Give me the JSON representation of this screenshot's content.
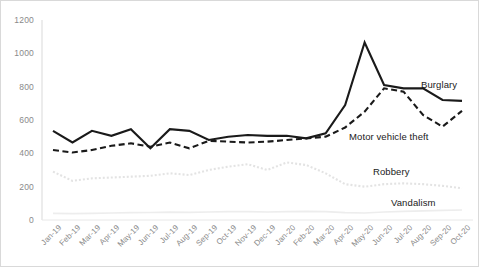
{
  "chart_data": {
    "type": "line",
    "title": "",
    "subtitle": "",
    "xlabel": "",
    "ylabel": "",
    "ylim": [
      0,
      1200
    ],
    "yticks": [
      0,
      200,
      400,
      600,
      800,
      1000,
      1200
    ],
    "ytick_labels": [
      "0",
      "200",
      "400",
      "600",
      "800",
      "1000",
      "1200"
    ],
    "grid": false,
    "legend_position": "inline-right",
    "categories": [
      "Jan-19",
      "Feb-19",
      "Mar-19",
      "Apr-19",
      "May-19",
      "Jun-19",
      "Jul-19",
      "Aug-19",
      "Sep-19",
      "Oct-19",
      "Nov-19",
      "Dec-19",
      "Jan-20",
      "Feb-20",
      "Mar-20",
      "Apr-20",
      "May-20",
      "Jun-20",
      "Jul-20",
      "Aug-20",
      "Sep-20",
      "Oct-20"
    ],
    "series": [
      {
        "name": "Burglary",
        "color": "#1a1a1a",
        "style": "solid",
        "width": 2.1,
        "label_x": 420,
        "label_y": 78,
        "values": [
          535,
          465,
          535,
          505,
          545,
          430,
          545,
          535,
          480,
          500,
          510,
          505,
          505,
          490,
          520,
          690,
          1065,
          810,
          790,
          790,
          720,
          715
        ]
      },
      {
        "name": "Motor vehicle theft",
        "color": "#1a1a1a",
        "style": "dashed",
        "width": 2.1,
        "label_x": 348,
        "label_y": 130,
        "values": [
          420,
          405,
          420,
          445,
          460,
          440,
          465,
          430,
          475,
          470,
          465,
          470,
          480,
          490,
          500,
          555,
          650,
          790,
          770,
          630,
          560,
          655
        ]
      },
      {
        "name": "Robbery",
        "color": "#e3e3e3",
        "style": "dotted",
        "width": 2.1,
        "label_x": 372,
        "label_y": 165,
        "values": [
          290,
          235,
          250,
          255,
          260,
          265,
          280,
          270,
          300,
          320,
          335,
          300,
          345,
          330,
          280,
          215,
          200,
          215,
          220,
          215,
          205,
          190
        ]
      },
      {
        "name": "Vandalism",
        "color": "#ededed",
        "style": "solid",
        "width": 1.6,
        "label_x": 390,
        "label_y": 196,
        "values": [
          40,
          38,
          40,
          42,
          44,
          45,
          47,
          46,
          48,
          50,
          50,
          48,
          50,
          52,
          50,
          44,
          42,
          48,
          52,
          55,
          58,
          60
        ]
      }
    ]
  },
  "axis": {
    "y_axis_line_color": "#d9d9d9",
    "x_axis_line_color": "#d9d9d9",
    "tick_text_color": "#8a8a8a"
  }
}
